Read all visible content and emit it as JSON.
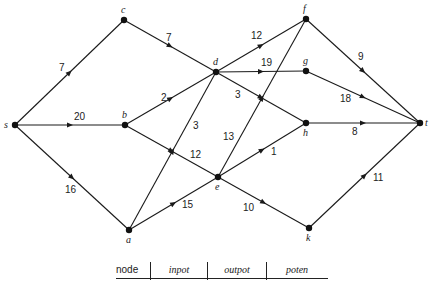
{
  "diagram": {
    "nodes": [
      {
        "id": "s",
        "label": "s",
        "x": 15,
        "y": 125,
        "lx": 4,
        "ly": 128
      },
      {
        "id": "c",
        "label": "c",
        "x": 124,
        "y": 20,
        "lx": 121,
        "ly": 13
      },
      {
        "id": "b",
        "label": "b",
        "x": 125,
        "y": 125,
        "lx": 122,
        "ly": 118
      },
      {
        "id": "a",
        "label": "a",
        "x": 129,
        "y": 230,
        "lx": 126,
        "ly": 243
      },
      {
        "id": "d",
        "label": "d",
        "x": 216,
        "y": 72,
        "lx": 213,
        "ly": 65
      },
      {
        "id": "e",
        "label": "e",
        "x": 218,
        "y": 177,
        "lx": 215,
        "ly": 190
      },
      {
        "id": "f",
        "label": "f",
        "x": 306,
        "y": 19,
        "lx": 303,
        "ly": 12
      },
      {
        "id": "g",
        "label": "g",
        "x": 306,
        "y": 71,
        "lx": 303,
        "ly": 64
      },
      {
        "id": "h",
        "label": "h",
        "x": 306,
        "y": 123,
        "lx": 303,
        "ly": 136
      },
      {
        "id": "k",
        "label": "k",
        "x": 309,
        "y": 228,
        "lx": 306,
        "ly": 241
      },
      {
        "id": "t",
        "label": "t",
        "x": 420,
        "y": 123,
        "lx": 425,
        "ly": 126
      }
    ],
    "edges": [
      {
        "from": "s",
        "to": "c",
        "weight": "7",
        "wx": 59,
        "wy": 71
      },
      {
        "from": "c",
        "to": "d",
        "weight": "7",
        "wx": 166,
        "wy": 41
      },
      {
        "from": "s",
        "to": "b",
        "weight": "20",
        "wx": 74,
        "wy": 120
      },
      {
        "from": "b",
        "to": "d",
        "weight": "2",
        "wx": 161,
        "wy": 101
      },
      {
        "from": "s",
        "to": "a",
        "weight": "16",
        "wx": 65,
        "wy": 193
      },
      {
        "from": "a",
        "to": "d",
        "weight": "3",
        "wx": 193,
        "wy": 129
      },
      {
        "from": "b",
        "to": "e",
        "weight": "12",
        "wx": 190,
        "wy": 158
      },
      {
        "from": "a",
        "to": "e",
        "weight": "15",
        "wx": 182,
        "wy": 208
      },
      {
        "from": "d",
        "to": "f",
        "weight": "12",
        "wx": 251,
        "wy": 39
      },
      {
        "from": "d",
        "to": "g",
        "weight": "19",
        "wx": 261,
        "wy": 66
      },
      {
        "from": "d",
        "to": "h",
        "weight": "3",
        "wx": 235,
        "wy": 98
      },
      {
        "from": "e",
        "to": "f",
        "weight": "13",
        "wx": 223,
        "wy": 140
      },
      {
        "from": "e",
        "to": "h",
        "weight": "1",
        "wx": 271,
        "wy": 155
      },
      {
        "from": "e",
        "to": "k",
        "weight": "10",
        "wx": 243,
        "wy": 211
      },
      {
        "from": "f",
        "to": "t",
        "weight": "9",
        "wx": 358,
        "wy": 60
      },
      {
        "from": "g",
        "to": "t",
        "weight": "18",
        "wx": 340,
        "wy": 102
      },
      {
        "from": "h",
        "to": "t",
        "weight": "8",
        "wx": 352,
        "wy": 135
      },
      {
        "from": "k",
        "to": "t",
        "weight": "11",
        "wx": 373,
        "wy": 181
      }
    ]
  },
  "table": {
    "headers": [
      "node",
      "inpot",
      "outpot",
      "poten"
    ]
  }
}
